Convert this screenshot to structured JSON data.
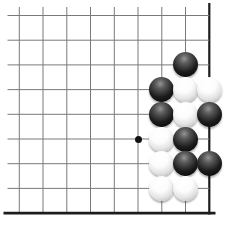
{
  "board": {
    "background": "#ffffff",
    "grid": {
      "columns_x": [
        19.3,
        43.0,
        66.8,
        90.5,
        114.3,
        138.0,
        161.8,
        185.5,
        209.3
      ],
      "rows_y": [
        15.5,
        40.2,
        64.9,
        89.6,
        114.3,
        139.0,
        163.7,
        188.4,
        213.1
      ],
      "thin_line_color": "#7a7a7a",
      "thin_line_width": 1,
      "edge_line_color": "#1c1c1c",
      "right_edge_width": 2.2,
      "bottom_edge_width": 2.6,
      "thin_vertical_top": 7,
      "thin_horizontal_left": 7.5,
      "right_edge_top": 3,
      "right_edge_bottom": 214.5,
      "bottom_edge_left": 3.5,
      "bottom_edge_right": 215.5
    },
    "hoshi": {
      "color": "#111111",
      "diameter": 7,
      "points": [
        {
          "col": 6,
          "row": 6
        }
      ]
    },
    "stones": {
      "diameter": 25,
      "list": [
        {
          "col": 8,
          "row": 3,
          "color": "black"
        },
        {
          "col": 7,
          "row": 4,
          "color": "black"
        },
        {
          "col": 8,
          "row": 4,
          "color": "white"
        },
        {
          "col": 9,
          "row": 4,
          "color": "white"
        },
        {
          "col": 7,
          "row": 5,
          "color": "black"
        },
        {
          "col": 8,
          "row": 5,
          "color": "white"
        },
        {
          "col": 9,
          "row": 5,
          "color": "black"
        },
        {
          "col": 7,
          "row": 6,
          "color": "white"
        },
        {
          "col": 8,
          "row": 6,
          "color": "black"
        },
        {
          "col": 7,
          "row": 7,
          "color": "white"
        },
        {
          "col": 8,
          "row": 7,
          "color": "black"
        },
        {
          "col": 9,
          "row": 7,
          "color": "black"
        },
        {
          "col": 7,
          "row": 8,
          "color": "white"
        },
        {
          "col": 8,
          "row": 8,
          "color": "white"
        }
      ]
    }
  }
}
